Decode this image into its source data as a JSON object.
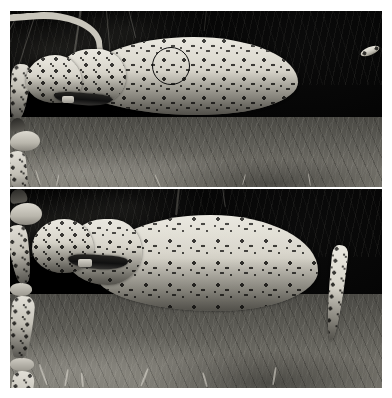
{
  "figure": {
    "type": "camera-trap-photo-pair",
    "background_color": "#ffffff",
    "width": 392,
    "height": 398,
    "panel_count": 2,
    "color_mode": "grayscale",
    "capture_mode": "infrared-night-flash"
  },
  "panels": [
    {
      "id": "panel-top",
      "label": "top-panel",
      "subject": "leopard",
      "orientation": "left-facing-profile",
      "x": 10,
      "y": 11,
      "width": 372,
      "height": 176,
      "background_description": "dark night scene with vegetation above and lit bare ground below",
      "features": {
        "collar": true,
        "collar_description": "dark radio-tracking collar around the neck",
        "tail_visible": true,
        "tail_position": "raised and curving up to the right"
      },
      "annotation": {
        "shape": "circle",
        "name": "rosette-identification-circle",
        "color": "#0d0d0d",
        "stroke_width": 1.6,
        "center_x": 171,
        "center_y": 66,
        "radius": 19,
        "purpose": "highlights the flank rosette pattern used for individual identification"
      }
    },
    {
      "id": "panel-bottom",
      "label": "bottom-panel",
      "subject": "leopard",
      "orientation": "left-facing-profile",
      "x": 10,
      "y": 189,
      "width": 372,
      "height": 199,
      "background_description": "dark night scene with lit grassy ground in the lower half",
      "features": {
        "collar": true,
        "collar_description": "dark radio-tracking collar around the neck",
        "tail_visible": true,
        "tail_position": "hanging down behind the hind leg"
      },
      "annotation": {
        "shape": "circle",
        "name": "rosette-identification-circle",
        "color": "#0d0d0d",
        "stroke_width": 1.6,
        "center_x": 177,
        "center_y": 66,
        "radius": 21,
        "purpose": "highlights the flank rosette pattern used for individual identification"
      }
    }
  ],
  "colors": {
    "paper": "#ffffff",
    "night_sky": "#050505",
    "ground_light": "#7a7870",
    "ground_dark": "#4a4944",
    "coat_light": "#e8e6dd",
    "coat_mid": "#b2afa4",
    "rosette": "#22211e",
    "annotation": "#0d0d0d"
  }
}
